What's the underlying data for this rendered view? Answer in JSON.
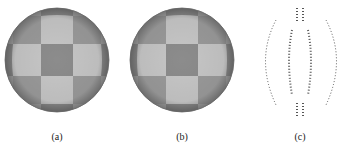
{
  "figure": {
    "panels": [
      {
        "id": "a",
        "caption": "(a)",
        "type": "checkered-sphere"
      },
      {
        "id": "b",
        "caption": "(b)",
        "type": "checkered-sphere"
      },
      {
        "id": "c",
        "caption": "(c)",
        "type": "dotted-difference-outline"
      }
    ],
    "colors": {
      "light_tile": "#c4c4c4",
      "dark_tile": "#8a8a8a",
      "dot": "#555555",
      "background": "#ffffff"
    }
  }
}
